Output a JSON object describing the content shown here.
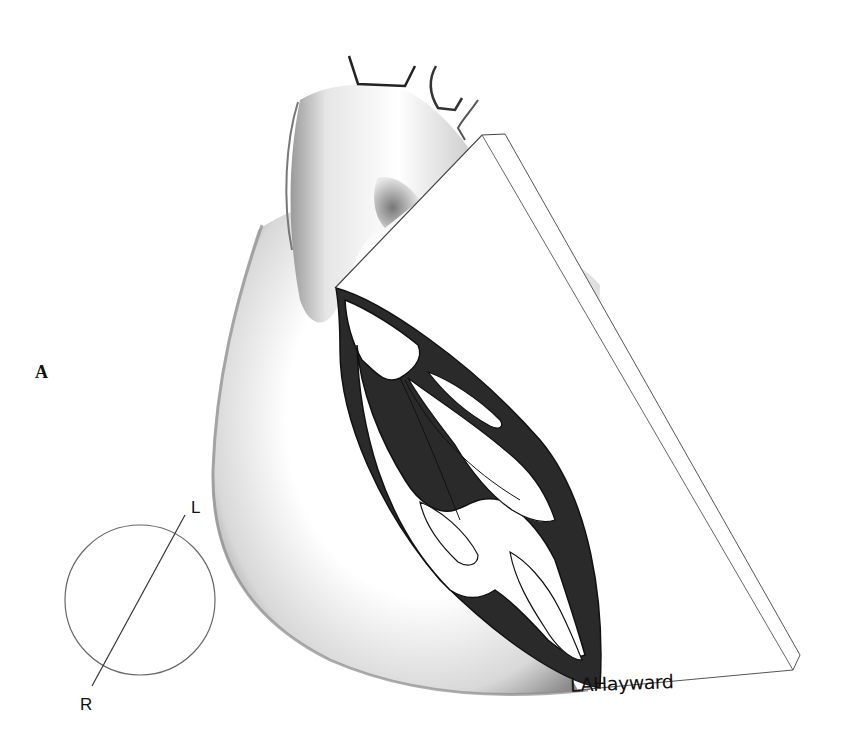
{
  "figure": {
    "panel_label": "A",
    "orientation_indicator": {
      "left_label": "L",
      "right_label": "R"
    },
    "signature": "LAHayward",
    "colors": {
      "background": "#ffffff",
      "myocardium": "#2a2a2a",
      "outline": "#222222",
      "shading": "#9a9a9a",
      "plane_edge": "#555555"
    }
  }
}
